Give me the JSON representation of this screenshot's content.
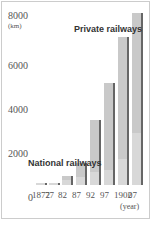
{
  "chart_data": {
    "type": "bar",
    "title": "",
    "xlabel": "(year)",
    "ylabel": "(km)",
    "ylim": [
      0,
      8000
    ],
    "yticks": [
      "0",
      "2000",
      "4000",
      "6000",
      "8000"
    ],
    "categories": [
      "1872",
      "77",
      "82",
      "87",
      "92",
      "97",
      "1902",
      "07"
    ],
    "series": [
      {
        "name": "Private railways",
        "values": [
          0,
          0,
          150,
          650,
          2400,
          4000,
          5600,
          5500
        ]
      },
      {
        "name": "National railways",
        "values": [
          30,
          100,
          250,
          350,
          600,
          700,
          1200,
          2400
        ]
      }
    ],
    "annotations": [
      "Private railways",
      "National railways"
    ]
  },
  "labels": {
    "private": "Private railways",
    "national": "National railways",
    "km": "(km)",
    "year": "(year)"
  }
}
